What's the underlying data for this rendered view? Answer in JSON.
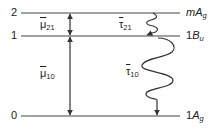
{
  "diagram": {
    "type": "energy-level-diagram",
    "levels": [
      {
        "index_label": "2",
        "state_label_prefix": "m",
        "state_label_main": "A",
        "state_label_sub": "g",
        "y": 13
      },
      {
        "index_label": "1",
        "state_label_prefix": "1",
        "state_label_main": "B",
        "state_label_sub": "u",
        "y": 36
      },
      {
        "index_label": "0",
        "state_label_prefix": "1",
        "state_label_main": "A",
        "state_label_sub": "g",
        "y": 116
      }
    ],
    "transition_dipoles": [
      {
        "symbol": "μ",
        "subscript": "21",
        "from": "2",
        "to": "1"
      },
      {
        "symbol": "μ",
        "subscript": "10",
        "from": "1",
        "to": "0"
      }
    ],
    "relaxation_times": [
      {
        "symbol": "τ",
        "subscript": "21",
        "from": "2",
        "to": "1"
      },
      {
        "symbol": "τ",
        "subscript": "10",
        "from": "1",
        "to": "0"
      }
    ],
    "colors": {
      "line": "#333333",
      "text": "#222222",
      "background": "#ffffff"
    }
  }
}
